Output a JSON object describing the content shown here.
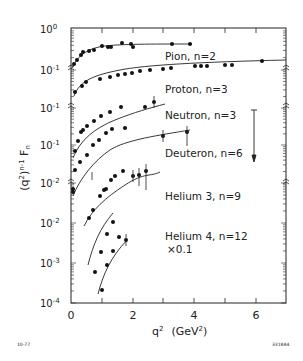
{
  "chart_data": {
    "type": "scatter",
    "title": "",
    "xlabel": "q² (GeV²)",
    "ylabel": "(q²)ⁿ⁻¹ Fₙ",
    "xlim": [
      0,
      7
    ],
    "x_ticks": [
      0,
      1,
      2,
      3,
      4,
      5,
      6,
      7
    ],
    "x_tick_labels": [
      "0",
      "2",
      "4",
      "6"
    ],
    "y_scale": "log (offset per series, with axis breaks)",
    "y_tick_labels": [
      "10⁰",
      "10⁻¹",
      "10⁻¹",
      "10⁻¹",
      "10⁻²",
      "10⁻²",
      "10⁻³",
      "10⁻⁴"
    ],
    "grid": false,
    "legend_position": "inline labels right of curves",
    "series": [
      {
        "name": "Pion, n=2",
        "label": "Pion, n=2",
        "points": [
          [
            0.1,
            0.17
          ],
          [
            0.2,
            0.2
          ],
          [
            0.35,
            0.25
          ],
          [
            0.55,
            0.3
          ],
          [
            0.65,
            0.32
          ],
          [
            0.95,
            0.36
          ],
          [
            1.15,
            0.36
          ],
          [
            1.3,
            0.36
          ],
          [
            1.6,
            0.42
          ],
          [
            1.8,
            0.38
          ],
          [
            1.85,
            0.35
          ],
          [
            3.1,
            0.38
          ],
          [
            3.7,
            0.38
          ]
        ]
      },
      {
        "name": "Proton, n=3",
        "label": "Proton, n=3",
        "points": [
          [
            0.1,
            0.028
          ],
          [
            0.35,
            0.045
          ],
          [
            0.5,
            0.055
          ],
          [
            0.95,
            0.065
          ],
          [
            1.3,
            0.075
          ],
          [
            1.6,
            0.08
          ],
          [
            1.95,
            0.085
          ],
          [
            2.2,
            0.088
          ],
          [
            2.5,
            0.09
          ],
          [
            2.7,
            0.09
          ],
          [
            3.1,
            0.095
          ],
          [
            3.3,
            0.095
          ],
          [
            4.2,
            0.1
          ],
          [
            4.4,
            0.1
          ],
          [
            4.6,
            0.1
          ],
          [
            5.2,
            0.105
          ],
          [
            5.5,
            0.105
          ],
          [
            6.3,
            0.11
          ]
        ]
      },
      {
        "name": "Neutron, n=3",
        "label": "Neutron, n=3",
        "points": [
          [
            0.1,
            0.02
          ],
          [
            0.25,
            0.03
          ],
          [
            0.35,
            0.035
          ],
          [
            0.45,
            0.04
          ],
          [
            0.65,
            0.05
          ],
          [
            0.8,
            0.055
          ],
          [
            0.9,
            0.06
          ],
          [
            1.3,
            0.07
          ],
          [
            1.6,
            0.075
          ],
          [
            2.5,
            0.08
          ],
          [
            3.0,
            0.085
          ]
        ]
      },
      {
        "name": "Deuteron, n=6",
        "label": "Deuteron, n=6",
        "points": [
          [
            0.4,
            0.003
          ],
          [
            0.55,
            0.005
          ],
          [
            0.7,
            0.007
          ],
          [
            0.95,
            0.01
          ],
          [
            1.05,
            0.009
          ],
          [
            1.2,
            0.012
          ],
          [
            1.4,
            0.015
          ],
          [
            1.6,
            0.018
          ],
          [
            1.8,
            0.02
          ],
          [
            2.1,
            0.022
          ],
          [
            2.5,
            0.024
          ],
          [
            3.6,
            0.028
          ],
          [
            3.9,
            0.03
          ]
        ]
      },
      {
        "name": "Helium 3, n=9",
        "label": "Helium 3, n=9",
        "points": [
          [
            0.95,
            0.0011
          ],
          [
            1.3,
            0.0018
          ],
          [
            1.6,
            0.0025
          ],
          [
            1.85,
            0.003
          ],
          [
            1.95,
            0.0029
          ],
          [
            2.2,
            0.0032
          ],
          [
            2.5,
            0.0033
          ],
          [
            2.95,
            0.005
          ]
        ]
      },
      {
        "name": "Helium 4, n=12 ×0.1",
        "label": "Helium 4, n=12",
        "sublabel": "×0.1",
        "points": [
          [
            0.8,
            0.0006
          ],
          [
            1.0,
            0.0011
          ],
          [
            1.2,
            0.002
          ],
          [
            1.4,
            0.003
          ],
          [
            1.0,
            0.00022
          ],
          [
            1.2,
            0.0005
          ],
          [
            1.4,
            0.0009
          ],
          [
            1.6,
            0.0015
          ],
          [
            1.75,
            0.0011
          ]
        ]
      }
    ],
    "annotations": [
      {
        "type": "arrow",
        "direction": "down",
        "x": 5.9,
        "description": "vertical down arrow near Deuteron label"
      }
    ],
    "footer_left": "10-77",
    "footer_right": "3318A4"
  },
  "labels": {
    "pion": "Pion, n=2",
    "proton": "Proton, n=3",
    "neutron": "Neutron, n=3",
    "deuteron": "Deuteron, n=6",
    "helium3": "Helium 3, n=9",
    "helium4": "Helium 4, n=12",
    "helium4_scale": "×0.1",
    "xlabel_q": "q",
    "xlabel_sup": "2",
    "xlabel_unit": "(GeV",
    "xlabel_unit_sup": "2",
    "xlabel_unit_close": ")",
    "x_ticks": [
      "0",
      "2",
      "4",
      "6"
    ],
    "y_ticks": [
      {
        "base": "10",
        "exp": "0"
      },
      {
        "base": "10",
        "exp": "-1"
      },
      {
        "base": "10",
        "exp": "-1"
      },
      {
        "base": "10",
        "exp": "-1"
      },
      {
        "base": "10",
        "exp": "-2"
      },
      {
        "base": "10",
        "exp": "-2"
      },
      {
        "base": "10",
        "exp": "-3"
      },
      {
        "base": "10",
        "exp": "-4"
      }
    ],
    "footer_left": "10-77",
    "footer_right": "3318A4"
  },
  "colors": {
    "ink": "#222222",
    "background": "#ffffff"
  }
}
